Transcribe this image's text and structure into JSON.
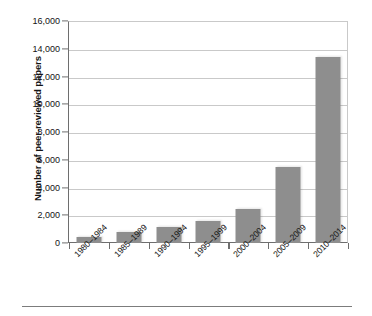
{
  "chart_data": {
    "type": "bar",
    "title": "",
    "subtitle": "",
    "xlabel": "",
    "ylabel": "Number of peer-reviewed papers",
    "categories": [
      "1980–1984",
      "1985–1989",
      "1990–1994",
      "1995–1999",
      "2000–2004",
      "2005–2009",
      "2010–2014"
    ],
    "values": [
      450,
      800,
      1150,
      1600,
      2450,
      5500,
      13400
    ],
    "ylim": [
      0,
      16000
    ],
    "ytick_labels": [
      "0",
      "2,000",
      "4,000",
      "6,000",
      "8,000",
      "10,000",
      "12,000",
      "14,000",
      "16,000"
    ],
    "ytick_values": [
      0,
      2000,
      4000,
      6000,
      8000,
      10000,
      12000,
      14000,
      16000
    ],
    "grid": "horizontal",
    "legend": "none",
    "bar_color": "#8e8e8e",
    "axis_color": "#6e6e6e",
    "gridline_color": "#c9c9c9",
    "xtick_label_rotation": "-45"
  }
}
